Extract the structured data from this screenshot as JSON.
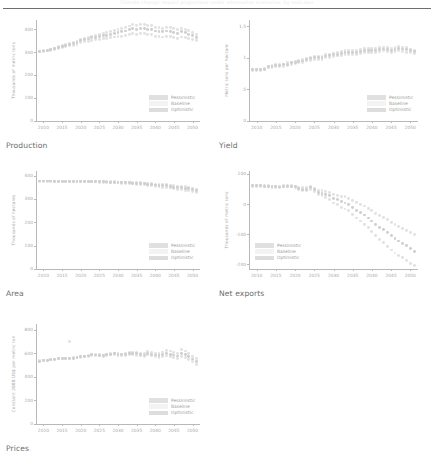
{
  "header": {
    "title": "Climate change impact projections under alternative scenarios, by indicator"
  },
  "legend": {
    "items": [
      {
        "key": "pessimistic",
        "label": "Pessimistic",
        "color": "#e0e0e0"
      },
      {
        "key": "baseline",
        "label": "Baseline",
        "color": "#f3f3f3"
      },
      {
        "key": "optimistic",
        "label": "Optimistic",
        "color": "#dddddd"
      }
    ]
  },
  "captions": {
    "production": "Production",
    "yield": "Yield",
    "area": "Area",
    "net_exports": "Net exports",
    "prices": "Prices"
  },
  "chart_data": [
    {
      "type": "scatter",
      "title": "Production",
      "xlabel": "",
      "ylabel": "Thousands of metric tons",
      "xlim": [
        2008,
        2052
      ],
      "ylim": [
        0,
        440
      ],
      "xticks": [
        2010,
        2015,
        2020,
        2025,
        2030,
        2035,
        2040,
        2045,
        2050
      ],
      "yticks": [
        0,
        100,
        200,
        300,
        400
      ],
      "grid": false,
      "legend_position": "lower-right",
      "x": [
        2009,
        2010,
        2011,
        2012,
        2013,
        2014,
        2015,
        2016,
        2017,
        2018,
        2019,
        2020,
        2021,
        2022,
        2023,
        2024,
        2025,
        2026,
        2027,
        2028,
        2029,
        2030,
        2031,
        2032,
        2033,
        2034,
        2035,
        2036,
        2037,
        2038,
        2039,
        2040,
        2041,
        2042,
        2043,
        2044,
        2045,
        2046,
        2047,
        2048,
        2049,
        2050,
        2051
      ],
      "series": [
        {
          "name": "Pessimistic",
          "values": [
            302,
            303,
            305,
            307,
            312,
            316,
            321,
            325,
            327,
            330,
            335,
            342,
            346,
            348,
            352,
            354,
            356,
            358,
            360,
            362,
            366,
            368,
            370,
            372,
            376,
            380,
            378,
            382,
            380,
            378,
            376,
            370,
            368,
            366,
            370,
            368,
            364,
            360,
            366,
            362,
            358,
            354,
            350
          ]
        },
        {
          "name": "Baseline",
          "values": [
            303,
            305,
            307,
            310,
            315,
            320,
            326,
            330,
            333,
            336,
            342,
            350,
            354,
            357,
            362,
            365,
            368,
            371,
            374,
            377,
            382,
            385,
            388,
            392,
            398,
            402,
            400,
            404,
            402,
            400,
            398,
            392,
            390,
            388,
            392,
            390,
            386,
            382,
            388,
            384,
            378,
            372,
            365
          ]
        },
        {
          "name": "Optimistic",
          "values": [
            304,
            306,
            309,
            313,
            318,
            324,
            330,
            335,
            338,
            342,
            348,
            356,
            361,
            364,
            370,
            373,
            377,
            381,
            385,
            389,
            395,
            399,
            403,
            408,
            414,
            419,
            417,
            421,
            419,
            417,
            415,
            408,
            406,
            404,
            409,
            406,
            402,
            398,
            404,
            400,
            393,
            386,
            378
          ]
        }
      ]
    },
    {
      "type": "scatter",
      "title": "Yield",
      "xlabel": "",
      "ylabel": "Metric tons per hectare",
      "xlim": [
        2008,
        2052
      ],
      "ylim": [
        0,
        1.6
      ],
      "xticks": [
        2010,
        2015,
        2020,
        2025,
        2030,
        2035,
        2040,
        2045,
        2050
      ],
      "yticks": [
        0,
        0.5,
        1,
        1.5
      ],
      "ytick_labels": [
        "0",
        ".5",
        "1",
        "1.5"
      ],
      "grid": false,
      "legend_position": "lower-right",
      "x": [
        2009,
        2010,
        2011,
        2012,
        2013,
        2014,
        2015,
        2016,
        2017,
        2018,
        2019,
        2020,
        2021,
        2022,
        2023,
        2024,
        2025,
        2026,
        2027,
        2028,
        2029,
        2030,
        2031,
        2032,
        2033,
        2034,
        2035,
        2036,
        2037,
        2038,
        2039,
        2040,
        2041,
        2042,
        2043,
        2044,
        2045,
        2046,
        2047,
        2048,
        2049,
        2050,
        2051
      ],
      "series": [
        {
          "name": "Pessimistic",
          "values": [
            0.8,
            0.8,
            0.8,
            0.81,
            0.84,
            0.85,
            0.86,
            0.86,
            0.87,
            0.88,
            0.9,
            0.91,
            0.92,
            0.92,
            0.95,
            0.96,
            0.97,
            0.97,
            0.98,
            1.0,
            1.01,
            1.02,
            1.03,
            1.04,
            1.06,
            1.05,
            1.05,
            1.06,
            1.07,
            1.08,
            1.09,
            1.09,
            1.09,
            1.1,
            1.11,
            1.1,
            1.09,
            1.1,
            1.11,
            1.1,
            1.09,
            1.08,
            1.07
          ]
        },
        {
          "name": "Baseline",
          "values": [
            0.81,
            0.81,
            0.81,
            0.82,
            0.86,
            0.87,
            0.88,
            0.88,
            0.89,
            0.9,
            0.92,
            0.93,
            0.94,
            0.95,
            0.97,
            0.99,
            1.0,
            1.0,
            1.01,
            1.03,
            1.04,
            1.05,
            1.06,
            1.07,
            1.09,
            1.08,
            1.08,
            1.09,
            1.1,
            1.12,
            1.12,
            1.12,
            1.12,
            1.13,
            1.14,
            1.13,
            1.12,
            1.13,
            1.15,
            1.14,
            1.13,
            1.11,
            1.1
          ]
        },
        {
          "name": "Optimistic",
          "values": [
            0.82,
            0.82,
            0.82,
            0.83,
            0.87,
            0.88,
            0.89,
            0.89,
            0.9,
            0.92,
            0.93,
            0.95,
            0.96,
            0.97,
            0.99,
            1.01,
            1.02,
            1.02,
            1.03,
            1.05,
            1.06,
            1.07,
            1.09,
            1.1,
            1.12,
            1.11,
            1.11,
            1.12,
            1.13,
            1.15,
            1.15,
            1.15,
            1.15,
            1.16,
            1.17,
            1.16,
            1.15,
            1.16,
            1.18,
            1.17,
            1.16,
            1.14,
            1.12
          ]
        }
      ]
    },
    {
      "type": "scatter",
      "title": "Area",
      "xlabel": "",
      "ylabel": "Thousands of hectares",
      "xlim": [
        2008,
        2052
      ],
      "ylim": [
        0,
        420
      ],
      "xticks": [
        2010,
        2015,
        2020,
        2025,
        2030,
        2035,
        2040,
        2045,
        2050
      ],
      "yticks": [
        0,
        100,
        200,
        300,
        400
      ],
      "grid": false,
      "legend_position": "lower-right",
      "x": [
        2009,
        2010,
        2011,
        2012,
        2013,
        2014,
        2015,
        2016,
        2017,
        2018,
        2019,
        2020,
        2021,
        2022,
        2023,
        2024,
        2025,
        2026,
        2027,
        2028,
        2029,
        2030,
        2031,
        2032,
        2033,
        2034,
        2035,
        2036,
        2037,
        2038,
        2039,
        2040,
        2041,
        2042,
        2043,
        2044,
        2045,
        2046,
        2047,
        2048,
        2049,
        2050,
        2051
      ],
      "series": [
        {
          "name": "Pessimistic",
          "values": [
            376,
            376,
            376,
            376,
            375,
            375,
            375,
            375,
            375,
            374,
            374,
            374,
            374,
            373,
            373,
            373,
            372,
            372,
            371,
            370,
            370,
            369,
            368,
            367,
            366,
            365,
            363,
            362,
            361,
            359,
            357,
            355,
            353,
            351,
            350,
            347,
            344,
            342,
            341,
            338,
            336,
            332,
            327
          ]
        },
        {
          "name": "Baseline",
          "values": [
            377,
            377,
            377,
            377,
            376,
            376,
            376,
            376,
            376,
            375,
            375,
            375,
            375,
            375,
            375,
            374,
            374,
            374,
            373,
            372,
            372,
            371,
            371,
            370,
            369,
            368,
            367,
            366,
            365,
            363,
            362,
            360,
            359,
            357,
            356,
            353,
            351,
            349,
            348,
            346,
            344,
            341,
            336
          ]
        },
        {
          "name": "Optimistic",
          "values": [
            377,
            377,
            377,
            377,
            377,
            377,
            377,
            377,
            377,
            376,
            376,
            376,
            376,
            376,
            376,
            376,
            375,
            375,
            375,
            374,
            374,
            373,
            373,
            372,
            372,
            371,
            370,
            369,
            368,
            367,
            366,
            364,
            363,
            362,
            361,
            359,
            357,
            355,
            354,
            352,
            350,
            347,
            343
          ]
        }
      ]
    },
    {
      "type": "scatter",
      "title": "Net exports",
      "xlabel": "",
      "ylabel": "Thousands of metric tons",
      "xlim": [
        2008,
        2052
      ],
      "ylim": [
        -215,
        110
      ],
      "xticks": [
        2010,
        2015,
        2020,
        2025,
        2030,
        2035,
        2040,
        2045,
        2050
      ],
      "yticks": [
        100,
        0,
        -100,
        -200
      ],
      "grid": false,
      "legend_position": "lower-left",
      "x": [
        2009,
        2010,
        2011,
        2012,
        2013,
        2014,
        2015,
        2016,
        2017,
        2018,
        2019,
        2020,
        2021,
        2022,
        2023,
        2024,
        2025,
        2026,
        2027,
        2028,
        2029,
        2030,
        2031,
        2032,
        2033,
        2034,
        2035,
        2036,
        2037,
        2038,
        2039,
        2040,
        2041,
        2042,
        2043,
        2044,
        2045,
        2046,
        2047,
        2048,
        2049,
        2050,
        2051
      ],
      "series": [
        {
          "name": "Pessimistic",
          "values": [
            60,
            59,
            60,
            58,
            58,
            56,
            56,
            55,
            57,
            58,
            57,
            55,
            48,
            45,
            44,
            48,
            42,
            32,
            28,
            22,
            16,
            4,
            -2,
            -10,
            -16,
            -22,
            -34,
            -46,
            -56,
            -66,
            -78,
            -92,
            -104,
            -118,
            -128,
            -140,
            -152,
            -162,
            -170,
            -178,
            -186,
            -196,
            -204
          ]
        },
        {
          "name": "Baseline",
          "values": [
            62,
            61,
            62,
            60,
            60,
            58,
            58,
            57,
            59,
            60,
            60,
            58,
            52,
            50,
            50,
            54,
            48,
            40,
            36,
            32,
            28,
            18,
            14,
            8,
            4,
            -2,
            -12,
            -20,
            -28,
            -36,
            -46,
            -56,
            -66,
            -76,
            -84,
            -94,
            -104,
            -114,
            -122,
            -130,
            -138,
            -148,
            -158
          ]
        },
        {
          "name": "Optimistic",
          "values": [
            63,
            62,
            63,
            62,
            62,
            60,
            60,
            59,
            61,
            62,
            62,
            60,
            55,
            54,
            55,
            58,
            53,
            46,
            44,
            42,
            40,
            32,
            30,
            26,
            24,
            20,
            12,
            6,
            0,
            -6,
            -14,
            -22,
            -30,
            -38,
            -44,
            -52,
            -60,
            -68,
            -74,
            -80,
            -86,
            -94,
            -102
          ]
        }
      ]
    },
    {
      "type": "scatter",
      "title": "Prices",
      "xlabel": "",
      "ylabel": "Constant 2000 US$ per metric ton",
      "xlim": [
        2008,
        2052
      ],
      "ylim": [
        0,
        850
      ],
      "xticks": [
        2010,
        2015,
        2020,
        2025,
        2030,
        2035,
        2040,
        2045,
        2050
      ],
      "yticks": [
        0,
        200,
        400,
        600,
        800
      ],
      "grid": false,
      "legend_position": "lower-right",
      "x": [
        2009,
        2010,
        2011,
        2012,
        2013,
        2014,
        2015,
        2016,
        2017,
        2018,
        2019,
        2020,
        2021,
        2022,
        2023,
        2024,
        2025,
        2026,
        2027,
        2028,
        2029,
        2030,
        2031,
        2032,
        2033,
        2034,
        2035,
        2036,
        2037,
        2038,
        2039,
        2040,
        2041,
        2042,
        2043,
        2044,
        2045,
        2046,
        2047,
        2048,
        2049,
        2050,
        2051
      ],
      "series": [
        {
          "name": "Pessimistic",
          "values": [
            536,
            540,
            542,
            548,
            552,
            556,
            556,
            560,
            700,
            562,
            568,
            572,
            578,
            582,
            592,
            590,
            588,
            586,
            592,
            598,
            600,
            596,
            592,
            598,
            610,
            612,
            606,
            600,
            596,
            618,
            608,
            600,
            596,
            612,
            628,
            620,
            610,
            600,
            630,
            620,
            600,
            576,
            560
          ]
        },
        {
          "name": "Baseline",
          "values": [
            534,
            538,
            540,
            546,
            550,
            554,
            554,
            558,
            558,
            560,
            566,
            570,
            574,
            578,
            588,
            586,
            584,
            582,
            588,
            594,
            596,
            592,
            588,
            592,
            600,
            602,
            596,
            590,
            586,
            602,
            594,
            586,
            580,
            590,
            600,
            594,
            586,
            578,
            596,
            588,
            572,
            552,
            534
          ]
        },
        {
          "name": "Optimistic",
          "values": [
            532,
            536,
            538,
            544,
            548,
            552,
            552,
            556,
            556,
            558,
            562,
            566,
            570,
            574,
            582,
            580,
            578,
            576,
            580,
            586,
            588,
            584,
            580,
            582,
            588,
            590,
            584,
            578,
            574,
            586,
            578,
            570,
            564,
            570,
            578,
            572,
            564,
            556,
            570,
            562,
            548,
            530,
            508
          ]
        }
      ]
    }
  ]
}
